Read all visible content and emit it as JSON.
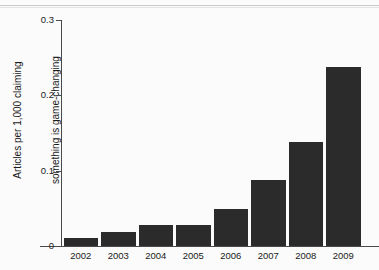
{
  "chart_data": {
    "type": "bar",
    "title": "",
    "xlabel": "",
    "ylabel": "Articles per 1,000 claiming\nsomething is game-changing",
    "ylabel_line1": "Articles per 1,000 claiming",
    "ylabel_line2": "something is game-changing",
    "categories": [
      "2002",
      "2003",
      "2004",
      "2005",
      "2006",
      "2007",
      "2008",
      "2009"
    ],
    "values": [
      0.011,
      0.019,
      0.028,
      0.028,
      0.049,
      0.088,
      0.138,
      0.238
    ],
    "ylim": [
      0,
      0.3
    ],
    "yticks": [
      0,
      0.1,
      0.2,
      0.3
    ],
    "ytick_labels": [
      "0",
      "0.1",
      "0.2",
      "0.3"
    ],
    "grid": false,
    "legend": "none",
    "bar_color": "#2b2b2b",
    "axis_color": "#4a4a4a",
    "background_color": "#fbfbfb"
  }
}
